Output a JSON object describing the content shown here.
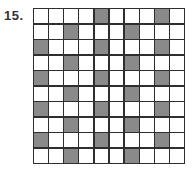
{
  "problem": {
    "number_label": "15."
  },
  "grid": {
    "rows": 10,
    "cols": 10,
    "shade_color": "#8a8a8a",
    "line_color": "#2e2e2e",
    "shaded_cells": [
      [
        0,
        0,
        0,
        0,
        1,
        0,
        0,
        0,
        1,
        0
      ],
      [
        0,
        0,
        1,
        0,
        0,
        0,
        1,
        0,
        0,
        0
      ],
      [
        1,
        0,
        0,
        0,
        1,
        0,
        0,
        0,
        1,
        0
      ],
      [
        0,
        0,
        1,
        0,
        0,
        0,
        1,
        0,
        0,
        0
      ],
      [
        1,
        0,
        0,
        0,
        1,
        0,
        0,
        0,
        1,
        0
      ],
      [
        0,
        0,
        1,
        0,
        0,
        0,
        1,
        0,
        0,
        0
      ],
      [
        1,
        0,
        0,
        0,
        1,
        0,
        0,
        0,
        1,
        0
      ],
      [
        0,
        0,
        1,
        0,
        0,
        0,
        1,
        0,
        0,
        0
      ],
      [
        1,
        0,
        0,
        0,
        1,
        0,
        0,
        0,
        1,
        0
      ],
      [
        0,
        0,
        1,
        0,
        0,
        0,
        1,
        0,
        0,
        0
      ]
    ],
    "shaded_count": 24,
    "total_cells": 100
  }
}
